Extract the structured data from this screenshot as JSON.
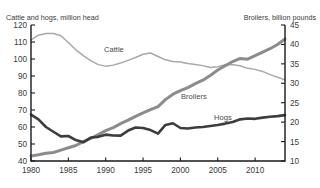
{
  "axes": {
    "left_title": "Cattle and hogs, million head",
    "right_title": "Broilers, billion pounds",
    "left_ticks": [
      "40",
      "50",
      "60",
      "70",
      "80",
      "90",
      "100",
      "110",
      "120"
    ],
    "right_ticks": [
      "10",
      "15",
      "20",
      "25",
      "30",
      "35",
      "40",
      "45"
    ],
    "x_ticks": [
      "1980",
      "1985",
      "1990",
      "1995",
      "2000",
      "2005",
      "2010"
    ]
  },
  "labels": {
    "cattle": "Cattle",
    "broilers": "Broilers",
    "hogs": "Hogs"
  },
  "colors": {
    "cattle": "#a8a8a8",
    "broilers": "#8c8c8c",
    "hogs": "#3d3d3d",
    "axis": "#1a1a1a",
    "background": "#ffffff"
  },
  "chart_data": {
    "type": "line",
    "title": "",
    "xlabel": "",
    "ylabel": "Cattle and hogs, million head",
    "y2label": "Broilers, billion pounds",
    "xlim": [
      1980,
      2014
    ],
    "ylim": [
      40,
      120
    ],
    "y2lim": [
      10,
      45
    ],
    "grid": false,
    "legend": "inline-annotations",
    "x": [
      1980,
      1981,
      1982,
      1983,
      1984,
      1985,
      1986,
      1987,
      1988,
      1989,
      1990,
      1991,
      1992,
      1993,
      1994,
      1995,
      1996,
      1997,
      1998,
      1999,
      2000,
      2001,
      2002,
      2003,
      2004,
      2005,
      2006,
      2007,
      2008,
      2009,
      2010,
      2011,
      2012,
      2013,
      2014
    ],
    "series": [
      {
        "name": "Cattle",
        "axis": "left",
        "units": "million head",
        "values": [
          111.2,
          114.0,
          115.0,
          115.0,
          113.7,
          109.7,
          105.4,
          102.0,
          99.0,
          96.7,
          95.8,
          96.4,
          97.6,
          99.2,
          100.9,
          102.8,
          103.5,
          101.5,
          99.5,
          98.5,
          98.2,
          97.3,
          96.7,
          96.1,
          95.0,
          95.4,
          96.7,
          96.6,
          96.0,
          94.5,
          93.9,
          92.7,
          90.8,
          89.3,
          87.7
        ]
      },
      {
        "name": "Broilers",
        "axis": "right",
        "units": "billion pounds",
        "values": [
          11.3,
          11.6,
          12.0,
          12.2,
          12.8,
          13.4,
          14.0,
          15.0,
          15.8,
          16.8,
          17.8,
          18.6,
          19.6,
          20.5,
          21.5,
          22.4,
          23.2,
          24.0,
          25.8,
          27.2,
          28.1,
          28.9,
          29.9,
          30.8,
          32.0,
          33.4,
          34.5,
          35.6,
          36.4,
          36.2,
          37.1,
          38.0,
          38.9,
          40.0,
          41.4
        ]
      },
      {
        "name": "Hogs",
        "axis": "left",
        "units": "million head",
        "values": [
          67.3,
          64.5,
          60.0,
          57.2,
          54.5,
          54.7,
          52.3,
          51.0,
          53.8,
          54.2,
          55.5,
          55.0,
          54.9,
          57.9,
          59.7,
          59.4,
          58.2,
          56.1,
          61.2,
          62.2,
          59.4,
          59.1,
          59.7,
          60.0,
          60.6,
          61.2,
          62.0,
          63.0,
          64.5,
          65.0,
          64.8,
          65.5,
          66.0,
          66.4,
          67.0
        ]
      }
    ]
  }
}
